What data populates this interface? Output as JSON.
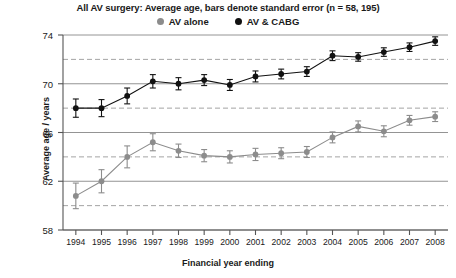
{
  "chart_data": {
    "type": "line",
    "title": "All AV surgery: Average age, bars denote standard error (n = 58, 195)",
    "xlabel": "Financial year ending",
    "ylabel": "Average age / years",
    "categories": [
      1994,
      1995,
      1996,
      1997,
      1998,
      1999,
      2000,
      2001,
      2002,
      2003,
      2004,
      2005,
      2006,
      2007,
      2008
    ],
    "x_tick_labels": [
      "1994",
      "1995",
      "1996",
      "1997",
      "1998",
      "1999",
      "2000",
      "2001",
      "2002",
      "2003",
      "2004",
      "2005",
      "2006",
      "2007",
      "2008"
    ],
    "y_tick_labels": [
      "58",
      "62",
      "66",
      "70",
      "74"
    ],
    "y_ticks": [
      58,
      62,
      66,
      70,
      74
    ],
    "ylim": [
      58,
      74
    ],
    "xlim": [
      1993.5,
      2008.5
    ],
    "grid": true,
    "gridlines_solid": [
      58,
      62,
      66,
      70,
      74
    ],
    "gridlines_dashed": [
      60,
      64,
      68,
      72
    ],
    "legend_position": "top-center",
    "series": [
      {
        "name": "AV alone",
        "color": "#8c8c8c",
        "marker": "circle",
        "values": [
          60.8,
          62.0,
          64.0,
          65.2,
          64.5,
          64.1,
          64.0,
          64.2,
          64.3,
          64.4,
          65.6,
          66.5,
          66.1,
          67.0,
          67.3
        ],
        "errors": [
          1.05,
          0.95,
          0.9,
          0.7,
          0.55,
          0.5,
          0.5,
          0.5,
          0.45,
          0.45,
          0.45,
          0.45,
          0.45,
          0.4,
          0.4
        ]
      },
      {
        "name": "AV & CABG",
        "color": "#111111",
        "marker": "circle",
        "values": [
          68.0,
          68.0,
          69.0,
          70.2,
          70.0,
          70.3,
          69.9,
          70.6,
          70.8,
          71.0,
          72.3,
          72.2,
          72.6,
          73.0,
          73.5
        ],
        "errors": [
          0.75,
          0.7,
          0.65,
          0.55,
          0.5,
          0.45,
          0.45,
          0.45,
          0.4,
          0.4,
          0.4,
          0.35,
          0.35,
          0.35,
          0.35
        ]
      }
    ]
  },
  "legend": {
    "entries": [
      {
        "label": "AV alone",
        "color": "#8c8c8c"
      },
      {
        "label": "AV & CABG",
        "color": "#111111"
      }
    ]
  }
}
